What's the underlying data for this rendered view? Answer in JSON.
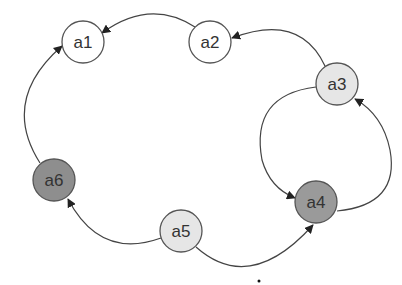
{
  "diagram": {
    "nodes": [
      {
        "id": "a1",
        "label": "a1",
        "cx": 83,
        "cy": 42,
        "r": 21,
        "fill": "#ffffff"
      },
      {
        "id": "a2",
        "label": "a2",
        "cx": 210,
        "cy": 42,
        "r": 21,
        "fill": "#ffffff"
      },
      {
        "id": "a3",
        "label": "a3",
        "cx": 337,
        "cy": 84,
        "r": 21,
        "fill": "#e6e6e6"
      },
      {
        "id": "a4",
        "label": "a4",
        "cx": 316,
        "cy": 202,
        "r": 21,
        "fill": "#9a9a9a"
      },
      {
        "id": "a5",
        "label": "a5",
        "cx": 181,
        "cy": 231,
        "r": 21,
        "fill": "#e6e6e6"
      },
      {
        "id": "a6",
        "label": "a6",
        "cx": 54,
        "cy": 180,
        "r": 21,
        "fill": "#8e8e8e"
      }
    ],
    "edges": [
      {
        "from": "a2",
        "to": "a1"
      },
      {
        "from": "a3",
        "to": "a2"
      },
      {
        "from": "a3",
        "to": "a4"
      },
      {
        "from": "a4",
        "to": "a3"
      },
      {
        "from": "a5",
        "to": "a4"
      },
      {
        "from": "a5",
        "to": "a6"
      },
      {
        "from": "a6",
        "to": "a1"
      }
    ],
    "colors": {
      "edge": "#444444",
      "node_stroke": "#555555",
      "text": "#333333"
    }
  }
}
